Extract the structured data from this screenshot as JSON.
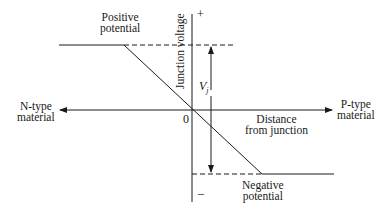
{
  "diagram": {
    "title": "",
    "labels": {
      "positive_potential": [
        "Positive",
        "potential"
      ],
      "negative_potential": [
        "Negative",
        "potential"
      ],
      "junction_voltage": "Junction voltage",
      "n_type": [
        "N-type",
        "material"
      ],
      "p_type": [
        "P-type",
        "material"
      ],
      "distance": [
        "Distance",
        "from junction"
      ],
      "origin": "0",
      "plus": "+",
      "minus": "–",
      "vj": "V",
      "vj_sub": "j"
    },
    "line_color": "#1a1a1a"
  }
}
